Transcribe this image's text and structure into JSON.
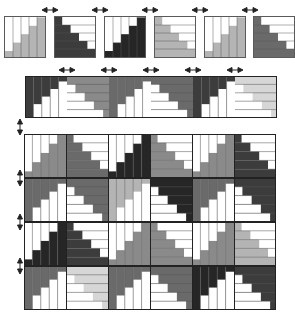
{
  "colors": {
    "white": "#ffffff",
    "light": "#d6d6d6",
    "mid": "#b4b4b4",
    "gray": "#8a8a8a",
    "darkgray": "#6a6a6a",
    "dark": "#3c3c3c",
    "black": "#262626",
    "line": "#555555",
    "border": "#222222"
  },
  "types": {
    "A": "vertical strips, staircase rising to the right (bottom-left to top-right)",
    "B": "horizontal strips, staircase descending to the right (filled bottom-left)",
    "C": "vertical strips, staircase rising to the right mirrored (filled right)",
    "D": "horizontal strips, staircase mirrored (filled bottom-right)"
  },
  "row1": {
    "blocks": [
      {
        "type": "A",
        "shade": "mid"
      },
      {
        "type": "B",
        "shade": "dark"
      },
      {
        "type": "A",
        "shade": "black"
      },
      {
        "type": "B",
        "shade": "mid"
      },
      {
        "type": "A",
        "shade": "mid"
      },
      {
        "type": "B",
        "shade": "darkgray"
      }
    ]
  },
  "row2": {
    "blocks": [
      {
        "type": "C",
        "shade": "dark"
      },
      {
        "type": "D",
        "shade": "gray"
      },
      {
        "type": "C",
        "shade": "darkgray"
      },
      {
        "type": "D",
        "shade": "darkgray"
      },
      {
        "type": "C",
        "shade": "dark"
      },
      {
        "type": "D",
        "shade": "light"
      }
    ]
  },
  "grid": {
    "rows": [
      [
        {
          "type": "A",
          "shade": "gray"
        },
        {
          "type": "B",
          "shade": "darkgray"
        },
        {
          "type": "A",
          "shade": "black"
        },
        {
          "type": "B",
          "shade": "gray"
        },
        {
          "type": "A",
          "shade": "gray"
        },
        {
          "type": "B",
          "shade": "dark"
        }
      ],
      [
        {
          "type": "C",
          "shade": "darkgray"
        },
        {
          "type": "D",
          "shade": "darkgray"
        },
        {
          "type": "C",
          "shade": "mid"
        },
        {
          "type": "D",
          "shade": "black"
        },
        {
          "type": "C",
          "shade": "darkgray"
        },
        {
          "type": "D",
          "shade": "dark"
        }
      ],
      [
        {
          "type": "A",
          "shade": "black"
        },
        {
          "type": "B",
          "shade": "dark"
        },
        {
          "type": "A",
          "shade": "gray"
        },
        {
          "type": "B",
          "shade": "gray"
        },
        {
          "type": "A",
          "shade": "gray"
        },
        {
          "type": "B",
          "shade": "mid"
        }
      ],
      [
        {
          "type": "C",
          "shade": "darkgray"
        },
        {
          "type": "D",
          "shade": "light"
        },
        {
          "type": "C",
          "shade": "darkgray"
        },
        {
          "type": "D",
          "shade": "darkgray"
        },
        {
          "type": "C",
          "shade": "black"
        },
        {
          "type": "D",
          "shade": "dark"
        }
      ]
    ]
  },
  "arrows": {
    "glyph": "double-headed arrow",
    "row1_count": 5,
    "row2_count": 5,
    "side_count": 4
  }
}
